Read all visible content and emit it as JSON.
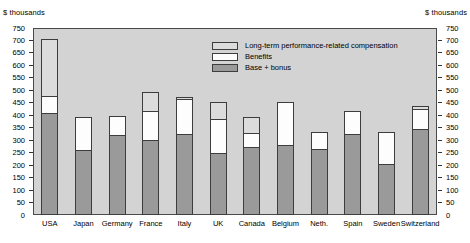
{
  "axis_captions": {
    "left": "$ thousands",
    "right": "$ thousands"
  },
  "legend": {
    "items": [
      {
        "key": "lti",
        "label": "Long-term performance-related compensation",
        "color": "#dcdcdc"
      },
      {
        "key": "benefits",
        "label": "Benefits",
        "color": "#fdfdfd"
      },
      {
        "key": "base",
        "label": "Base + bonus",
        "color": "#9a9a9a"
      }
    ]
  },
  "chart_data": {
    "type": "bar",
    "stacked": true,
    "title": "",
    "xlabel": "",
    "ylabel": "$ thousands",
    "ylim": [
      0,
      750
    ],
    "ytick_step": 50,
    "yticks": [
      0,
      50,
      100,
      150,
      200,
      250,
      300,
      350,
      400,
      450,
      500,
      550,
      600,
      650,
      700,
      750
    ],
    "ytick_labels": [
      "0",
      "50",
      "100",
      "150",
      "200",
      "250",
      "300",
      "350",
      "400",
      "450",
      "500",
      "550",
      "600",
      "650",
      "700",
      "750"
    ],
    "grid": false,
    "legend_position": "upper-center",
    "dual_axis": true,
    "categories": [
      "USA",
      "Japan",
      "Germany",
      "France",
      "Italy",
      "UK",
      "Canada",
      "Belgium",
      "Neth.",
      "Spain",
      "Sweden",
      "Switzerland"
    ],
    "series": [
      {
        "name": "Base + bonus",
        "values": [
          405,
          258,
          315,
          295,
          320,
          245,
          270,
          275,
          262,
          320,
          200,
          340
        ]
      },
      {
        "name": "Benefits",
        "values": [
          70,
          133,
          78,
          117,
          140,
          135,
          55,
          175,
          65,
          95,
          130,
          80
        ]
      },
      {
        "name": "Long-term performance-related compensation",
        "values": [
          225,
          0,
          0,
          78,
          8,
          70,
          65,
          0,
          0,
          0,
          0,
          15
        ]
      }
    ],
    "totals": [
      700,
      391,
      393,
      490,
      468,
      450,
      390,
      450,
      327,
      415,
      330,
      435
    ]
  }
}
